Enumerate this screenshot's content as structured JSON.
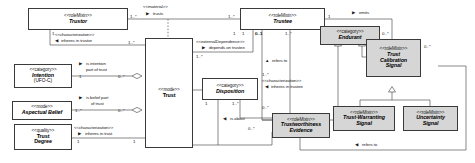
{
  "diagram": {
    "type": "uml-class-diagram",
    "background": "#ffffff",
    "line_color": "#3a3a3a",
    "shaded_fill": "#d6d6d6"
  },
  "classes": [
    {
      "id": "trustor",
      "stereotype": "<<roleMixin>>",
      "name": "Trustor",
      "sub": "",
      "shaded": false
    },
    {
      "id": "trustee",
      "stereotype": "<<roleMixin>>",
      "name": "Trustee",
      "sub": "",
      "shaded": false
    },
    {
      "id": "trust",
      "stereotype": "<<mode>>",
      "name": "Trust",
      "sub": "",
      "shaded": false
    },
    {
      "id": "intention",
      "stereotype": "<<category>>",
      "name": "Intention",
      "sub": "(UFO-C)",
      "shaded": false
    },
    {
      "id": "aspectual",
      "stereotype": "<<mode>>",
      "name": "Aspectual Belief",
      "sub": "",
      "shaded": false
    },
    {
      "id": "trustdegree",
      "stereotype": "<<quality>>",
      "name": "Trust Degree",
      "sub": "",
      "shaded": false
    },
    {
      "id": "disposition",
      "stereotype": "<<category>>",
      "name": "Disposition",
      "sub": "",
      "shaded": false
    },
    {
      "id": "evidence",
      "stereotype": "<<roleMixin>>",
      "name": "Trustworthiness Evidence",
      "sub": "",
      "shaded": true
    },
    {
      "id": "endurant",
      "stereotype": "<<category>>",
      "name": "Endurant",
      "sub": "",
      "shaded": true
    },
    {
      "id": "tcsignal",
      "stereotype": "<<roleMixin>>",
      "name": "Trust Calibration Signal",
      "sub": "",
      "shaded": true
    },
    {
      "id": "twsignal",
      "stereotype": "<<roleMixin>>",
      "name": "Trust-Warranting Signal",
      "sub": "",
      "shaded": true
    },
    {
      "id": "uncsignal",
      "stereotype": "<<roleMixin>>",
      "name": "Uncertainty Signal",
      "sub": "",
      "shaded": true
    }
  ],
  "class_text": {
    "trustor": {
      "stereotype": "<<roleMixin>>",
      "name": "Trustor"
    },
    "trustee": {
      "stereotype": "<<roleMixin>>",
      "name": "Trustee"
    },
    "trust": {
      "stereotype": "<<mode>>",
      "name": "Trust"
    },
    "intention": {
      "stereotype": "<<category>>",
      "name": "Intention",
      "sub": "(UFO-C)"
    },
    "aspectual": {
      "stereotype": "<<mode>>",
      "name": "Aspectual Belief"
    },
    "trustdegree": {
      "stereotype": "<<quality>>",
      "name1": "Trust",
      "name2": "Degree"
    },
    "disposition": {
      "stereotype": "<<category>>",
      "name": "Disposition"
    },
    "evidence": {
      "stereotype": "<<roleMixin>>",
      "name1": "Trustworthiness",
      "name2": "Evidence"
    },
    "endurant": {
      "stereotype": "<<category>>",
      "name": "Endurant"
    },
    "tcsignal": {
      "stereotype": "<<roleMixin>>",
      "name1": "Trust",
      "name2": "Calibration",
      "name3": "Signal"
    },
    "twsignal": {
      "stereotype": "<<roleMixin>>",
      "name1": "Trust-Warranting",
      "name2": "Signal"
    },
    "uncsignal": {
      "stereotype": "<<roleMixin>>",
      "name1": "Uncertainty",
      "name2": "Signal"
    }
  },
  "relations": {
    "trusts": {
      "stereotype": "<<material>>",
      "name": "trusts",
      "arrow": "▶"
    },
    "inheres_or": {
      "stereotype": "<<characterization>>",
      "name": "inheres in trustor",
      "arrow": "◀"
    },
    "intention_pt": {
      "stereotype": "",
      "name1": "is intention",
      "name2": "part of trust",
      "arrow": "▶"
    },
    "belief_pt": {
      "stereotype": "",
      "name1": "is belief part",
      "name2": "of trust",
      "arrow": "▶"
    },
    "inheres_tr": {
      "stereotype": "<<characterization>>",
      "name": "inheres in trust",
      "arrow": "▶"
    },
    "depends": {
      "stereotype": "<<externalDependence>>",
      "name": "depends on trustee",
      "arrow": "▶"
    },
    "inheres_te": {
      "stereotype": "<<characterization>>",
      "name": "inheres in trustee",
      "arrow": "◀"
    },
    "is_about": {
      "stereotype": "",
      "name": "is about",
      "arrow": "◀"
    },
    "refers_to_up": {
      "stereotype": "",
      "name": "refers to",
      "arrow": "▲"
    },
    "refers_to_lo": {
      "stereotype": "",
      "name": "refers to",
      "arrow": "◀"
    },
    "emits": {
      "stereotype": "",
      "name": "emits",
      "arrow": "▶"
    }
  },
  "multiplicities": {
    "trustor_right": "1..*",
    "trustor_bottom": "1",
    "trusts_right": "1..*",
    "inheres_or_right": "1..*",
    "intention_left": "1",
    "intention_right": "0..*",
    "belief_left": "1..*",
    "belief_right": "0..*",
    "inheres_tr_left": "1",
    "inheres_tr_right": "1",
    "trustee_l1": "1",
    "trustee_l2": "0..1",
    "trustee_l3": "1..*",
    "trustee_emits": "1",
    "depends_left": "1",
    "depends_right": "0..1",
    "depends_below": "1..*",
    "inheres_te_above": "1..*",
    "inheres_te_below": "0..*",
    "disposition_left": "1",
    "disposition_right": "1..*",
    "is_about_below": "0..*",
    "tcs_top": "0..*",
    "tcs_right": "0..*"
  }
}
